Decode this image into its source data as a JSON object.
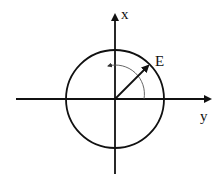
{
  "diagram": {
    "labels": {
      "x_axis": "x",
      "y_axis": "y",
      "vector": "E"
    },
    "colors": {
      "stroke": "#111111",
      "arc": "#555555",
      "background": "#ffffff"
    }
  }
}
